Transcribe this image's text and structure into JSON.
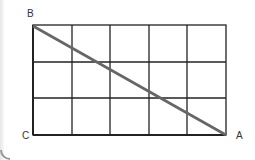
{
  "diagram": {
    "type": "grid-with-diagonal",
    "columns": 5,
    "rows": 3,
    "labels": {
      "B": "B",
      "C": "C",
      "A": "A"
    },
    "colors": {
      "grid": "#222222",
      "diagonal": "#666666"
    }
  }
}
